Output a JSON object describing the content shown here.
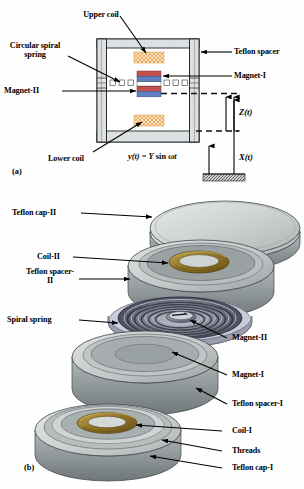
{
  "figure": {
    "panel_a": {
      "id": "(a)",
      "labels": {
        "upper_coil": "Upper coil",
        "circular_spiral_spring": "Circular spiral spring",
        "magnet_ii": "Magnet-II",
        "lower_coil": "Lower coil",
        "teflon_spacer": "Teflon spacer",
        "magnet_i": "Magnet-I"
      },
      "equation": {
        "lhs": "y(t)",
        "eq": " = ",
        "rhs_amp": "Y",
        "rhs_fn": " sin ",
        "rhs_arg": "ωt",
        "full": "y(t) = Y sin ωt"
      },
      "motion_vars": {
        "relative": "Z(t)",
        "absolute": "X(t)"
      },
      "colors": {
        "coil_fill": "#f7c98a",
        "magnet_north": "#c2514d",
        "magnet_south": "#5f7fc0",
        "housing_fill": "#d9dde0",
        "body_fill": "#ffffff",
        "outline": "#1a1a1a"
      }
    },
    "panel_b": {
      "id": "(b)",
      "labels": {
        "teflon_cap_ii": "Teflon cap-II",
        "coil_ii": "Coil-II",
        "teflon_spacer_ii": "Teflon spacer-II",
        "spiral_spring": "Spiral spring",
        "magnet_ii": "Magnet-II",
        "magnet_i": "Magnet-I",
        "teflon_spacer_i": "Teflon spacer-I",
        "coil_i": "Coil-I",
        "threads": "Threads",
        "teflon_cap_i": "Teflon cap-I"
      },
      "colors": {
        "disc_top": "#d2d6d6",
        "disc_side": "#8f9697",
        "disc_edge": "#5d6364",
        "coil_gold": "#8a6f22",
        "coil_gold_light": "#b79a41",
        "spring_dark": "#3a3a48",
        "spring_light": "#b9bac8",
        "magnet_body": "#7e8190"
      }
    }
  }
}
